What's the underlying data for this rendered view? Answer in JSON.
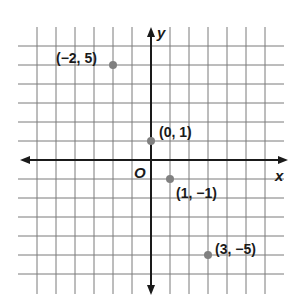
{
  "chart_data": {
    "type": "scatter",
    "title": "",
    "xlabel": "x",
    "ylabel": "y",
    "origin_label": "O",
    "grid": true,
    "xlim": [
      -6,
      6
    ],
    "ylim": [
      -6,
      6
    ],
    "points": [
      {
        "x": -2,
        "y": 5,
        "label": "(−2, 5)"
      },
      {
        "x": 0,
        "y": 1,
        "label": "(0, 1)"
      },
      {
        "x": 1,
        "y": -1,
        "label": "(1, −1)"
      },
      {
        "x": 3,
        "y": -5,
        "label": "(3, −5)"
      }
    ]
  },
  "colors": {
    "grid": "#7a7a7a",
    "axis": "#1a1a1a",
    "point": "#808080",
    "text": "#1a1a1a"
  },
  "labels": {
    "x_axis": "x",
    "y_axis": "y",
    "origin": "O",
    "p1": "(−2, 5)",
    "p2": "(0, 1)",
    "p3": "(1, −1)",
    "p4": "(3, −5)"
  }
}
